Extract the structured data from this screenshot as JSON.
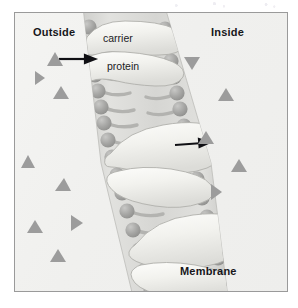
{
  "figure": {
    "type": "cell-membrane-diagram",
    "border_color": "#9a9a9a",
    "background_color": "#f2f2f0"
  },
  "labels": {
    "outside": "Outside",
    "inside": "Inside",
    "membrane": "Membrane",
    "carrier": "carrier",
    "protein": "protein"
  },
  "colors": {
    "text": "#16161a",
    "particle": "#9c9c9c",
    "lipid_head": "#a8a8a8",
    "lipid_tail": "#b5b5b5",
    "protein_fill": "#f5f5f2",
    "membrane_band": "#d9d9d6",
    "arrow": "#101014"
  },
  "membrane": {
    "orientation": "vertical-diagonal",
    "outer_side": "left",
    "inner_side": "right",
    "lipid_head_count_left": 14,
    "lipid_head_count_right": 14
  },
  "carrier_proteins": [
    {
      "id": "top-carrier",
      "label": "carrier protein",
      "position": "top"
    },
    {
      "id": "middle-carrier",
      "label": "",
      "position": "middle"
    },
    {
      "id": "bottom-carrier",
      "label": "",
      "position": "bottom"
    }
  ],
  "arrows": [
    {
      "id": "arrow-top",
      "direction": "right",
      "meaning": "solute entering membrane"
    },
    {
      "id": "arrow-middle",
      "direction": "right",
      "meaning": "solute exiting to inside"
    }
  ],
  "particles_outside": [
    {
      "x": 20,
      "y": 64,
      "rot": -90,
      "size": 8
    },
    {
      "x": 45,
      "y": 79,
      "rot": 0,
      "size": 9
    },
    {
      "x": 12,
      "y": 148,
      "rot": -100,
      "size": 9
    },
    {
      "x": 47,
      "y": 170,
      "rot": 8,
      "size": 8
    },
    {
      "x": 18,
      "y": 212,
      "rot": -5,
      "size": 9
    },
    {
      "x": 62,
      "y": 210,
      "rot": 100,
      "size": 8
    },
    {
      "x": 42,
      "y": 240,
      "rot": 5,
      "size": 9
    }
  ],
  "particles_inside": [
    {
      "x": 176,
      "y": 50,
      "rot": 180,
      "size": 9
    },
    {
      "x": 211,
      "y": 78,
      "rot": 0,
      "size": 10
    },
    {
      "x": 190,
      "y": 122,
      "rot": -5,
      "size": 9
    },
    {
      "x": 224,
      "y": 150,
      "rot": 0,
      "size": 9
    },
    {
      "x": 200,
      "y": 178,
      "rot": 95,
      "size": 8
    }
  ],
  "particles_membrane_edge": [
    {
      "x": 52,
      "y": 42,
      "rot": 0,
      "size": 10
    }
  ]
}
